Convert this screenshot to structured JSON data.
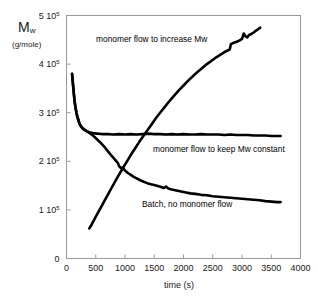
{
  "chart_data": {
    "type": "line",
    "title": "",
    "xlabel": "time (s)",
    "ylabel": "M w  (g/mole)",
    "ylabel_symbol": "M",
    "ylabel_subscript": "w",
    "ylabel_units": "(g/mole)",
    "xlim": [
      0,
      4000
    ],
    "ylim": [
      0,
      500000
    ],
    "grid": false,
    "legend_position": "inline-annotations",
    "xticks": [
      0,
      500,
      1000,
      1500,
      2000,
      2500,
      3000,
      3500,
      4000
    ],
    "xtick_labels": [
      "0",
      "500",
      "1000",
      "1500",
      "2000",
      "2500",
      "3000",
      "3500",
      "4000"
    ],
    "yticks": [
      0,
      100000,
      200000,
      300000,
      400000,
      500000
    ],
    "ytick_mantissas": [
      "0",
      "1",
      "2",
      "3",
      "4",
      "5"
    ],
    "ytick_exponent": "5",
    "ytick_base": "10",
    "annotations": [
      {
        "text": "monomer flow to increase Mw",
        "x": 1500,
        "y": 448000
      },
      {
        "text": "monomer flow to keep Mw constant",
        "x": 2450,
        "y": 228000
      },
      {
        "text": "Batch, no monomer flow",
        "x": 2200,
        "y": 118000
      }
    ],
    "series": [
      {
        "name": "monomer flow to increase Mw",
        "color": "#000000",
        "points": [
          [
            390,
            62000
          ],
          [
            430,
            70000
          ],
          [
            470,
            79000
          ],
          [
            510,
            88000
          ],
          [
            560,
            99000
          ],
          [
            610,
            110000
          ],
          [
            660,
            121000
          ],
          [
            710,
            132000
          ],
          [
            760,
            143000
          ],
          [
            820,
            156000
          ],
          [
            880,
            169000
          ],
          [
            940,
            181000
          ],
          [
            1000,
            193000
          ],
          [
            1060,
            205000
          ],
          [
            1120,
            217000
          ],
          [
            1180,
            228000
          ],
          [
            1250,
            241000
          ],
          [
            1320,
            253000
          ],
          [
            1390,
            265000
          ],
          [
            1460,
            277000
          ],
          [
            1530,
            289000
          ],
          [
            1600,
            300000
          ],
          [
            1680,
            312000
          ],
          [
            1760,
            324000
          ],
          [
            1840,
            335000
          ],
          [
            1920,
            346000
          ],
          [
            2000,
            356000
          ],
          [
            2080,
            366000
          ],
          [
            2160,
            375000
          ],
          [
            2240,
            384000
          ],
          [
            2320,
            392000
          ],
          [
            2400,
            400000
          ],
          [
            2480,
            407000
          ],
          [
            2560,
            414000
          ],
          [
            2640,
            420000
          ],
          [
            2720,
            426000
          ],
          [
            2790,
            430000
          ],
          [
            2810,
            441000
          ],
          [
            2860,
            444000
          ],
          [
            2910,
            446000
          ],
          [
            2960,
            449000
          ],
          [
            3000,
            452000
          ],
          [
            3030,
            463000
          ],
          [
            3060,
            457000
          ],
          [
            3090,
            455000
          ],
          [
            3120,
            460000
          ],
          [
            3160,
            462000
          ],
          [
            3200,
            465000
          ],
          [
            3240,
            469000
          ],
          [
            3280,
            472000
          ],
          [
            3310,
            475000
          ]
        ]
      },
      {
        "name": "monomer flow to keep Mw constant",
        "color": "#000000",
        "points": [
          [
            95,
            380000
          ],
          [
            110,
            360000
          ],
          [
            125,
            340000
          ],
          [
            140,
            322000
          ],
          [
            155,
            310000
          ],
          [
            170,
            300000
          ],
          [
            185,
            292000
          ],
          [
            200,
            286000
          ],
          [
            215,
            280000
          ],
          [
            230,
            275000
          ],
          [
            250,
            271000
          ],
          [
            270,
            268000
          ],
          [
            300,
            265000
          ],
          [
            340,
            262000
          ],
          [
            390,
            260000
          ],
          [
            450,
            258000
          ],
          [
            520,
            257000
          ],
          [
            600,
            256000
          ],
          [
            700,
            256000
          ],
          [
            800,
            255000
          ],
          [
            900,
            256000
          ],
          [
            1000,
            255000
          ],
          [
            1100,
            256000
          ],
          [
            1200,
            255000
          ],
          [
            1300,
            256000
          ],
          [
            1400,
            257000
          ],
          [
            1500,
            256000
          ],
          [
            1600,
            256000
          ],
          [
            1700,
            255000
          ],
          [
            1800,
            256000
          ],
          [
            1900,
            255000
          ],
          [
            2000,
            256000
          ],
          [
            2100,
            255000
          ],
          [
            2200,
            255000
          ],
          [
            2300,
            256000
          ],
          [
            2400,
            255000
          ],
          [
            2500,
            255000
          ],
          [
            2600,
            255000
          ],
          [
            2700,
            254000
          ],
          [
            2800,
            255000
          ],
          [
            2900,
            254000
          ],
          [
            3000,
            254000
          ],
          [
            3100,
            254000
          ],
          [
            3200,
            253000
          ],
          [
            3300,
            253000
          ],
          [
            3400,
            253000
          ],
          [
            3500,
            252000
          ],
          [
            3600,
            252000
          ],
          [
            3660,
            252000
          ]
        ]
      },
      {
        "name": "Batch, no monomer flow",
        "color": "#000000",
        "points": [
          [
            95,
            380000
          ],
          [
            110,
            360000
          ],
          [
            125,
            340000
          ],
          [
            140,
            322000
          ],
          [
            155,
            310000
          ],
          [
            170,
            300000
          ],
          [
            185,
            292000
          ],
          [
            200,
            286000
          ],
          [
            215,
            280000
          ],
          [
            230,
            276000
          ],
          [
            250,
            272000
          ],
          [
            280,
            268000
          ],
          [
            320,
            264000
          ],
          [
            370,
            260000
          ],
          [
            420,
            256000
          ],
          [
            480,
            250000
          ],
          [
            540,
            243000
          ],
          [
            600,
            236000
          ],
          [
            660,
            228000
          ],
          [
            720,
            219000
          ],
          [
            780,
            210000
          ],
          [
            840,
            202000
          ],
          [
            880,
            196000
          ],
          [
            900,
            190000
          ],
          [
            930,
            186000
          ],
          [
            960,
            187000
          ],
          [
            1000,
            181000
          ],
          [
            1050,
            176000
          ],
          [
            1100,
            172000
          ],
          [
            1150,
            168000
          ],
          [
            1200,
            165000
          ],
          [
            1260,
            161000
          ],
          [
            1320,
            158000
          ],
          [
            1380,
            155000
          ],
          [
            1440,
            153000
          ],
          [
            1500,
            151000
          ],
          [
            1560,
            149000
          ],
          [
            1620,
            147000
          ],
          [
            1660,
            145000
          ],
          [
            1700,
            148000
          ],
          [
            1740,
            144000
          ],
          [
            1800,
            142000
          ],
          [
            1880,
            140000
          ],
          [
            1960,
            138000
          ],
          [
            2040,
            136000
          ],
          [
            2120,
            134000
          ],
          [
            2200,
            133000
          ],
          [
            2300,
            131000
          ],
          [
            2400,
            130000
          ],
          [
            2500,
            128000
          ],
          [
            2600,
            127000
          ],
          [
            2700,
            126000
          ],
          [
            2800,
            125000
          ],
          [
            2900,
            124000
          ],
          [
            3000,
            123000
          ],
          [
            3100,
            122000
          ],
          [
            3200,
            121000
          ],
          [
            3300,
            120000
          ],
          [
            3400,
            118000
          ],
          [
            3500,
            117000
          ],
          [
            3600,
            116000
          ],
          [
            3660,
            116000
          ]
        ]
      }
    ]
  }
}
